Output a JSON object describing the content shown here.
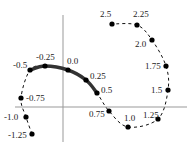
{
  "diagram": {
    "type": "curve-diagram",
    "axes": {
      "x_axis": {
        "x1": 15,
        "x2": 187,
        "y": 107
      },
      "y_axis": {
        "x": 63,
        "y1": 15,
        "y2": 142
      },
      "color": "#999999"
    },
    "points": [
      {
        "label": "-1.25",
        "x": 32,
        "y": 134,
        "lx": 8,
        "ly": 138
      },
      {
        "label": "-1.0",
        "x": 26,
        "y": 117,
        "lx": 4,
        "ly": 120
      },
      {
        "label": "-0.75",
        "x": 21,
        "y": 98,
        "lx": 26,
        "ly": 101
      },
      {
        "label": "-0.5",
        "x": 30,
        "y": 70,
        "lx": 13,
        "ly": 68
      },
      {
        "label": "-0.25",
        "x": 45,
        "y": 66,
        "lx": 36,
        "ly": 60
      },
      {
        "label": "0.0",
        "x": 68,
        "y": 70,
        "lx": 67,
        "ly": 64
      },
      {
        "label": "0.25",
        "x": 86,
        "y": 80,
        "lx": 90,
        "ly": 79
      },
      {
        "label": "0.5",
        "x": 97,
        "y": 93,
        "lx": 101,
        "ly": 93
      },
      {
        "label": "0.75",
        "x": 109,
        "y": 111,
        "lx": 89,
        "ly": 117
      },
      {
        "label": "1.0",
        "x": 128,
        "y": 127,
        "lx": 124,
        "ly": 121
      },
      {
        "label": "1.25",
        "x": 158,
        "y": 119,
        "lx": 143,
        "ly": 118
      },
      {
        "label": "1.5",
        "x": 168,
        "y": 90,
        "lx": 151,
        "ly": 93
      },
      {
        "label": "1.75",
        "x": 166,
        "y": 66,
        "lx": 145,
        "ly": 69
      },
      {
        "label": "2.0",
        "x": 152,
        "y": 40,
        "lx": 135,
        "ly": 47
      },
      {
        "label": "2.25",
        "x": 137,
        "y": 25,
        "lx": 133,
        "ly": 17
      },
      {
        "label": "2.5",
        "x": 112,
        "y": 24,
        "lx": 100,
        "ly": 17
      }
    ],
    "colors": {
      "curve": "#111111",
      "thick_segment": "#333333",
      "axis": "#999999"
    }
  }
}
